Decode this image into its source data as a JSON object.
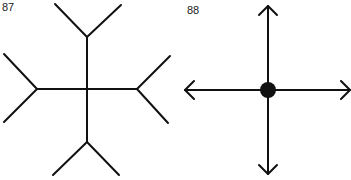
{
  "figures": [
    {
      "number": "87",
      "description": "Cross with forked (Y-shaped) ends on all four arms"
    },
    {
      "number": "88",
      "description": "Cross with arrowheads on all four arms and a filled dot at center"
    }
  ],
  "colors": {
    "stroke": "#111111",
    "background": "#ffffff"
  }
}
